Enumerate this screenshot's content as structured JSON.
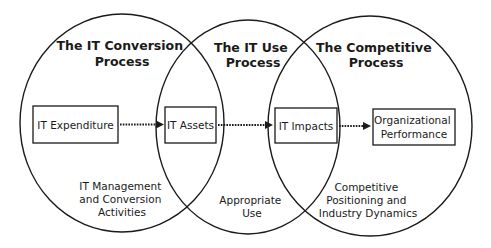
{
  "diagram": {
    "processes": [
      {
        "id": "it-conversion",
        "title_lines": [
          "The IT Conversion",
          "Process"
        ],
        "caption_lines": [
          "IT Management",
          "and Conversion",
          "Activities"
        ]
      },
      {
        "id": "it-use",
        "title_lines": [
          "The IT Use",
          "Process"
        ],
        "caption_lines": [
          "Appropriate",
          "Use"
        ]
      },
      {
        "id": "competitive",
        "title_lines": [
          "The Competitive",
          "Process"
        ],
        "caption_lines": [
          "Competitive",
          "Positioning and",
          "Industry Dynamics"
        ]
      }
    ],
    "boxes": [
      {
        "id": "it-expenditure",
        "label_lines": [
          "IT Expenditure"
        ]
      },
      {
        "id": "it-assets",
        "label_lines": [
          "IT Assets"
        ]
      },
      {
        "id": "it-impacts",
        "label_lines": [
          "IT Impacts"
        ]
      },
      {
        "id": "organizational-performance",
        "label_lines": [
          "Organizational",
          "Performance"
        ]
      }
    ],
    "flows": [
      {
        "from": "it-expenditure",
        "to": "it-assets",
        "style": "dotted-arrow"
      },
      {
        "from": "it-assets",
        "to": "it-impacts",
        "style": "dotted-arrow"
      },
      {
        "from": "it-impacts",
        "to": "organizational-performance",
        "style": "dotted-arrow"
      }
    ],
    "colors": {
      "stroke": "#1a1a1a",
      "background": "#ffffff"
    }
  }
}
